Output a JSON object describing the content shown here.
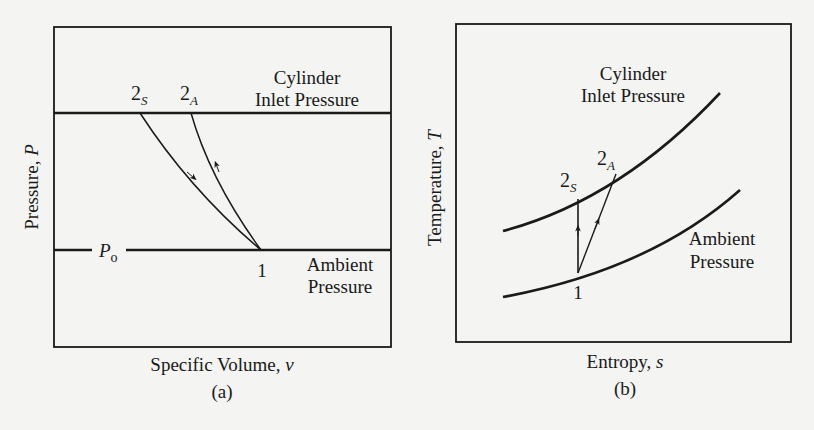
{
  "panels": [
    {
      "id": "a",
      "caption": "(a)",
      "xlabel_text": "Specific Volume, ",
      "xlabel_var": "v",
      "ylabel_text": "Pressure, ",
      "ylabel_var": "P",
      "upper_line_label_1": "Cylinder",
      "upper_line_label_2": "Inlet Pressure",
      "lower_line_label_1": "Ambient",
      "lower_line_label_2": "Pressure",
      "p0_main": "P",
      "p0_sub": "o",
      "point_1": "1",
      "point_2s_main": "2",
      "point_2s_sub": "S",
      "point_2a_main": "2",
      "point_2a_sub": "A"
    },
    {
      "id": "b",
      "caption": "(b)",
      "xlabel_text": "Entropy, ",
      "xlabel_var": "s",
      "ylabel_text": "Temperature, ",
      "ylabel_var": "T",
      "upper_curve_label_1": "Cylinder",
      "upper_curve_label_2": "Inlet Pressure",
      "lower_curve_label_1": "Ambient",
      "lower_curve_label_2": "Pressure",
      "point_1": "1",
      "point_2s_main": "2",
      "point_2s_sub": "S",
      "point_2a_main": "2",
      "point_2a_sub": "A"
    }
  ],
  "colors": {
    "ink": "#1a1a1a",
    "paper": "#f4f4f2"
  }
}
